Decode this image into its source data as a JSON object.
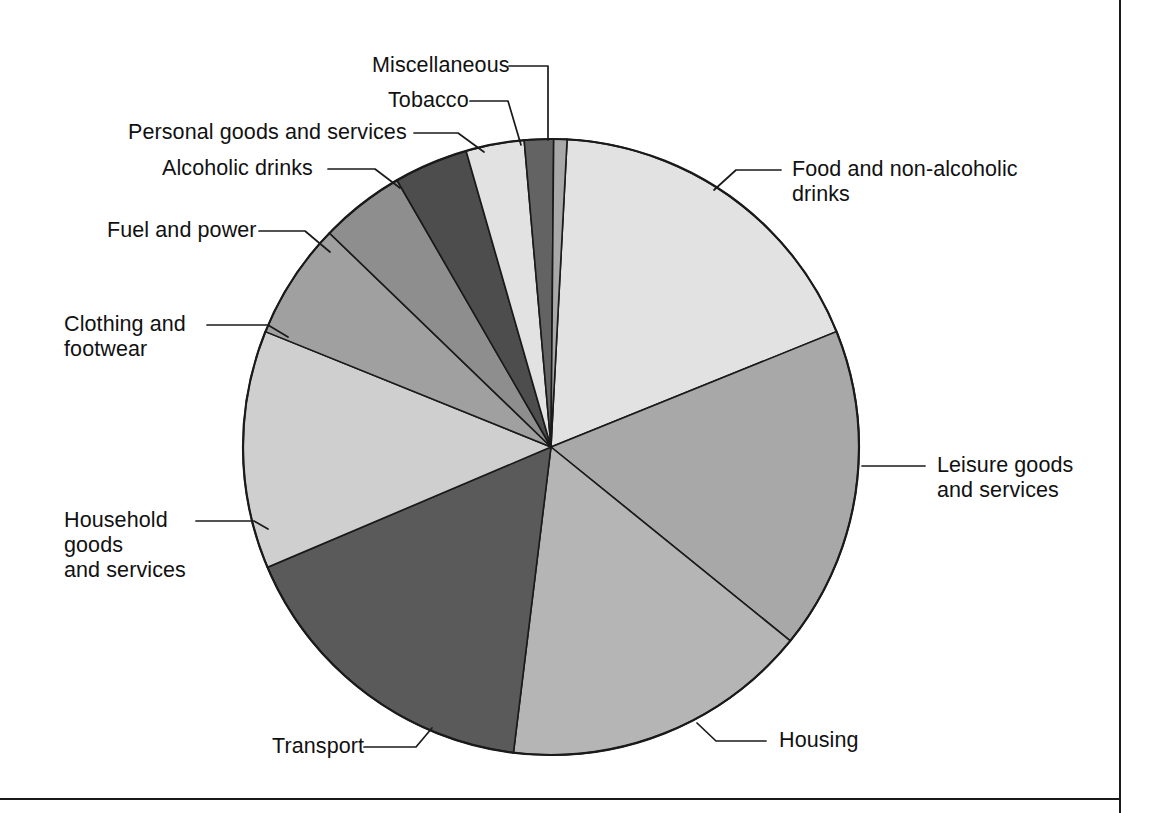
{
  "figure": {
    "type": "pie-chart",
    "background": "#ffffff",
    "border_color": "#1a1a1a"
  },
  "chart_data": {
    "type": "pie",
    "title": "",
    "subtitle": "",
    "xlabel": "",
    "ylabel": "",
    "grid": false,
    "legend_position": "callout-labels",
    "start_angle_deg": 3,
    "direction": "clockwise",
    "center": {
      "x": 551,
      "y": 447
    },
    "radius": 308,
    "categories": [
      "Food and non-alcoholic drinks",
      "Leisure goods and services",
      "Housing",
      "Transport",
      "Household goods and services",
      "Clothing and footwear",
      "Fuel and power",
      "Alcoholic drinks",
      "Personal goods and services",
      "Tobacco",
      "Miscellaneous"
    ],
    "values": [
      18.0,
      17.0,
      16.0,
      16.5,
      12.5,
      6.0,
      4.5,
      4.0,
      3.0,
      1.5,
      1.0
    ],
    "unit": "per cent of total household expenditure",
    "slices": [
      {
        "label": "Food and non-alcoholic drinks",
        "value": 18.0,
        "start_deg": 3,
        "end_deg": 68,
        "color": "#e2e2e2"
      },
      {
        "label": "Leisure goods and services",
        "value": 17.0,
        "start_deg": 68,
        "end_deg": 129,
        "color": "#a8a8a8"
      },
      {
        "label": "Housing",
        "value": 16.0,
        "start_deg": 129,
        "end_deg": 187,
        "color": "#b5b5b5"
      },
      {
        "label": "Transport",
        "value": 16.5,
        "start_deg": 187,
        "end_deg": 247,
        "color": "#5a5a5a"
      },
      {
        "label": "Household goods and services",
        "value": 12.5,
        "start_deg": 247,
        "end_deg": 292,
        "color": "#cfcfcf"
      },
      {
        "label": "Clothing and footwear",
        "value": 6.0,
        "start_deg": 292,
        "end_deg": 314,
        "color": "#a0a0a0"
      },
      {
        "label": "Fuel and power",
        "value": 4.5,
        "start_deg": 314,
        "end_deg": 330,
        "color": "#8e8e8e"
      },
      {
        "label": "Alcoholic drinks",
        "value": 4.0,
        "start_deg": 330,
        "end_deg": 344,
        "color": "#4d4d4d"
      },
      {
        "label": "Personal goods and services",
        "value": 3.0,
        "start_deg": 344,
        "end_deg": 355,
        "color": "#e2e2e2"
      },
      {
        "label": "Tobacco",
        "value": 1.5,
        "start_deg": 355,
        "end_deg": 360.5,
        "color": "#636363"
      },
      {
        "label": "Miscellaneous",
        "value": 1.0,
        "start_deg": 360.5,
        "end_deg": 363,
        "color": "#a8a8a8"
      }
    ]
  },
  "labels": {
    "miscellaneous": "Miscellaneous",
    "tobacco": "Tobacco",
    "personal_goods": "Personal goods and services",
    "alcoholic_drinks": "Alcoholic drinks",
    "fuel_and_power": "Fuel and power",
    "clothing_and_footwear": "Clothing and\nfootwear",
    "household_goods": "Household\ngoods\nand services",
    "transport": "Transport",
    "housing": "Housing",
    "leisure_goods": "Leisure goods\nand services",
    "food_drinks": "Food and non-alcoholic\ndrinks"
  }
}
